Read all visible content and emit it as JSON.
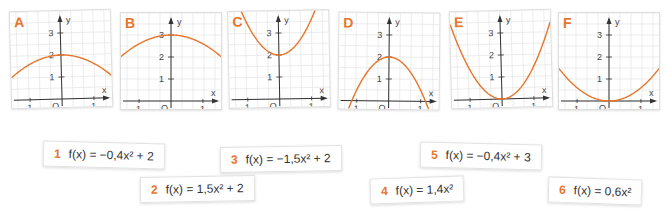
{
  "accent_color": "#e8752a",
  "graphs": [
    {
      "id": "A",
      "label": "A",
      "a": -0.4,
      "c": 2,
      "left": 10,
      "top": 10,
      "rot": -1.5
    },
    {
      "id": "B",
      "label": "B",
      "a": -0.4,
      "c": 3,
      "left": 120,
      "top": 12,
      "rot": 0
    },
    {
      "id": "C",
      "label": "C",
      "a": 1.5,
      "c": 2,
      "left": 228,
      "top": 10,
      "rot": -1
    },
    {
      "id": "D",
      "label": "D",
      "a": -1.5,
      "c": 2,
      "left": 338,
      "top": 12,
      "rot": 0.5
    },
    {
      "id": "E",
      "label": "E",
      "a": 1.4,
      "c": 0,
      "left": 450,
      "top": 10,
      "rot": -1.5
    },
    {
      "id": "F",
      "label": "F",
      "a": 0.6,
      "c": 0,
      "left": 558,
      "top": 12,
      "rot": 0
    }
  ],
  "axis": {
    "x_label": "x",
    "y_label": "y",
    "origin_label": "O",
    "ticks_x": [
      "-1",
      "1"
    ],
    "ticks_y": [
      "1",
      "2",
      "3"
    ]
  },
  "equations": [
    {
      "num": "1",
      "text": "f(x) = −0,4x² + 2",
      "left": 43,
      "top": 142,
      "rot": 1.5
    },
    {
      "num": "2",
      "text": "f(x) = 1,5x² + 2",
      "left": 140,
      "top": 176,
      "rot": -1
    },
    {
      "num": "3",
      "text": "f(x) = −1,5x² + 2",
      "left": 220,
      "top": 146,
      "rot": -1
    },
    {
      "num": "4",
      "text": "f(x) = 1,4x²",
      "left": 370,
      "top": 177,
      "rot": -2
    },
    {
      "num": "5",
      "text": "f(x) = −0,4x² + 3",
      "left": 420,
      "top": 143,
      "rot": 1.5
    },
    {
      "num": "6",
      "text": "f(x) = 0,6x²",
      "left": 548,
      "top": 178,
      "rot": 2
    }
  ]
}
